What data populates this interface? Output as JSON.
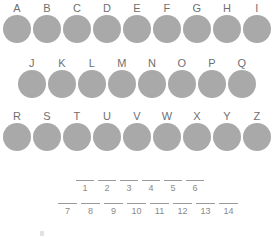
{
  "worksheet": {
    "title": "Lettered circle tokens with numbered answer blanks",
    "background_color": "#ffffff",
    "circle_color": "#a9a9a9",
    "label_color": "#6f6f6f",
    "number_color": "#8a8a8a",
    "blank_line_color": "#9a9a9a"
  },
  "circle_rows": [
    {
      "row_name": "row-1",
      "labels": [
        "A",
        "B",
        "C",
        "D",
        "E",
        "F",
        "G",
        "H",
        "I"
      ]
    },
    {
      "row_name": "row-2",
      "labels": [
        "J",
        "K",
        "L",
        "M",
        "N",
        "O",
        "P",
        "Q"
      ]
    },
    {
      "row_name": "row-3",
      "labels": [
        "R",
        "S",
        "T",
        "U",
        "V",
        "W",
        "X",
        "Y",
        "Z"
      ]
    }
  ],
  "answer_blanks": [
    {
      "row_name": "blanks-top",
      "numbers": [
        "1",
        "2",
        "3",
        "4",
        "5",
        "6"
      ],
      "values": [
        "",
        "",
        "",
        "",
        "",
        ""
      ]
    },
    {
      "row_name": "blanks-bottom",
      "numbers": [
        "7",
        "8",
        "9",
        "10",
        "11",
        "12",
        "13",
        "14"
      ],
      "values": [
        "",
        "",
        "",
        "",
        "",
        "",
        "",
        ""
      ]
    }
  ]
}
